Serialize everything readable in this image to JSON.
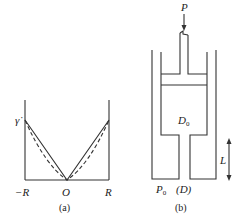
{
  "figure_a": {
    "caption": "(a)",
    "y_label": "γ̇",
    "x_labels": {
      "left": "−R",
      "center": "O",
      "right": "R"
    },
    "curves": [
      {
        "name": "linear-profile",
        "style": "solid"
      },
      {
        "name": "curved-profile",
        "style": "dashed"
      }
    ]
  },
  "figure_b": {
    "caption": "(b)",
    "force_label": "P",
    "chamber_label": "D",
    "chamber_label_sub": "0",
    "pressure_label": "P",
    "pressure_label_sub": "0",
    "nozzle_label": "(D)",
    "length_label": "L"
  },
  "colors": {
    "stroke": "#333333",
    "background": "#ffffff"
  }
}
